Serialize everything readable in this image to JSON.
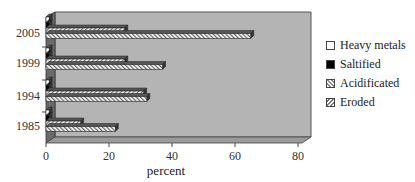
{
  "chart_data": {
    "type": "bar",
    "orientation": "horizontal",
    "style": "3d-clustered",
    "title": "",
    "xlabel": "percent",
    "ylabel": "",
    "xlim": [
      0,
      80
    ],
    "xticks": [
      "0",
      "20",
      "40",
      "60",
      "80"
    ],
    "categories": [
      "1985",
      "1994",
      "1999",
      "2005"
    ],
    "series": [
      {
        "name": "Heavy metals",
        "values": [
          1,
          1,
          1,
          1
        ]
      },
      {
        "name": "Saltified",
        "values": [
          1,
          1,
          1,
          1
        ]
      },
      {
        "name": "Acidificated",
        "values": [
          11,
          31,
          25,
          25
        ]
      },
      {
        "name": "Eroded",
        "values": [
          22,
          32,
          37,
          65
        ]
      }
    ],
    "legend_position": "right",
    "grid": false
  },
  "legend": {
    "items": [
      "Heavy metals",
      "Saltified",
      "Acidificated",
      "Eroded"
    ]
  },
  "axis": {
    "xlabel": "percent",
    "xticks": [
      "0",
      "20",
      "40",
      "60",
      "80"
    ],
    "yticks": [
      "2005",
      "1999",
      "1994",
      "1985"
    ]
  }
}
